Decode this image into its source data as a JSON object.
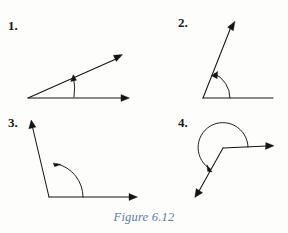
{
  "page": {
    "background_color": "#fdfdfb",
    "width": 288,
    "height": 233,
    "ink_color": "#141414"
  },
  "caption": {
    "text": "Figure 6.12",
    "color": "#5b7ba5",
    "style": "italic"
  },
  "problems": [
    {
      "number": "1.",
      "label_position": {
        "x": 8,
        "y": 19
      },
      "angle_type": "acute",
      "approx_degrees": 25,
      "vertex": {
        "x": 28,
        "y": 98
      },
      "rays": [
        {
          "name": "horizontal-ray",
          "end": {
            "x": 127,
            "y": 98
          },
          "arrow": true
        },
        {
          "name": "diagonal-ray",
          "end": {
            "x": 120,
            "y": 56
          },
          "arrow": true
        }
      ],
      "arc": {
        "radius": 46,
        "start_degrees": 0,
        "end_degrees": 25,
        "arrow_at": "end"
      }
    },
    {
      "number": "2.",
      "label_position": {
        "x": 178,
        "y": 16
      },
      "angle_type": "acute",
      "approx_degrees": 68,
      "vertex": {
        "x": 203,
        "y": 98
      },
      "rays": [
        {
          "name": "horizontal-ray",
          "end": {
            "x": 273,
            "y": 98
          },
          "arrow": false
        },
        {
          "name": "diagonal-ray",
          "end": {
            "x": 234,
            "y": 23
          },
          "arrow": true
        }
      ],
      "arc": {
        "radius": 27,
        "start_degrees": 0,
        "end_degrees": 68,
        "arrow_at": "end"
      }
    },
    {
      "number": "3.",
      "label_position": {
        "x": 8,
        "y": 116
      },
      "angle_type": "obtuse",
      "approx_degrees": 104,
      "vertex": {
        "x": 49,
        "y": 197
      },
      "rays": [
        {
          "name": "horizontal-ray",
          "end": {
            "x": 136,
            "y": 197
          },
          "arrow": true
        },
        {
          "name": "upper-ray",
          "end": {
            "x": 31,
            "y": 122
          },
          "arrow": true
        }
      ],
      "arc": {
        "radius": 34,
        "start_degrees": 0,
        "end_degrees": 104,
        "arrow_at": "end"
      }
    },
    {
      "number": "4.",
      "label_position": {
        "x": 178,
        "y": 116
      },
      "angle_type": "reflex",
      "approx_degrees": 240,
      "vertex": {
        "x": 223,
        "y": 148
      },
      "rays": [
        {
          "name": "horizontal-ray",
          "end": {
            "x": 272,
            "y": 146
          },
          "arrow": true
        },
        {
          "name": "lower-left-ray",
          "end": {
            "x": 196,
            "y": 196
          },
          "arrow": true
        }
      ],
      "arc": {
        "radius": 25,
        "start_degrees": 0,
        "end_degrees": 240,
        "arrow_at": "end"
      }
    }
  ]
}
